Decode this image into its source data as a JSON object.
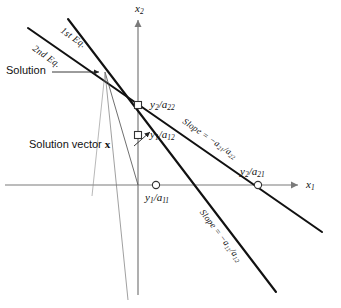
{
  "figure": {
    "type": "geometry-diagram",
    "axes": {
      "x_axis_label": "x₁",
      "y_axis_label": "x₂",
      "x_axis_label_parts": {
        "base": "x",
        "sub": "1"
      },
      "y_axis_label_parts": {
        "base": "x",
        "sub": "2"
      }
    },
    "lines": [
      {
        "name": "first-equation",
        "label": "1st Eq.",
        "slope_label": "Slope = −a₁₁/a₁₂",
        "slope_label_parts": {
          "prefix": "Slope = −",
          "num_base": "a",
          "num_sub": "11",
          "den_base": "a",
          "den_sub": "12"
        },
        "x_intercept_label": "y₁/a₁₁",
        "x_intercept_parts": {
          "num_base": "y",
          "num_sub": "1",
          "den_base": "a",
          "den_sub": "11"
        },
        "y_intercept_label": "y₁/a₁₂",
        "y_intercept_parts": {
          "num_base": "y",
          "num_sub": "1",
          "den_base": "a",
          "den_sub": "12"
        }
      },
      {
        "name": "second-equation",
        "label": "2nd Eq.",
        "slope_label": "Slope = −a₂₁/a₂₂",
        "slope_label_parts": {
          "prefix": "Slope = −",
          "num_base": "a",
          "num_sub": "21",
          "den_base": "a",
          "den_sub": "22"
        },
        "x_intercept_label": "y₂/a₂₁",
        "x_intercept_parts": {
          "num_base": "y",
          "num_sub": "2",
          "den_base": "a",
          "den_sub": "21"
        },
        "y_intercept_label": "y₂/a₂₂",
        "y_intercept_parts": {
          "num_base": "y",
          "num_sub": "2",
          "den_base": "a",
          "den_sub": "22"
        }
      }
    ],
    "annotations": {
      "solution_label": "Solution",
      "solution_vector_label": "Solution vector",
      "solution_vector_symbol": "x"
    },
    "colors": {
      "line": "#111111",
      "axis": "#7a7a7a",
      "background": "#ffffff",
      "marker_fill": "#ffffff"
    }
  }
}
